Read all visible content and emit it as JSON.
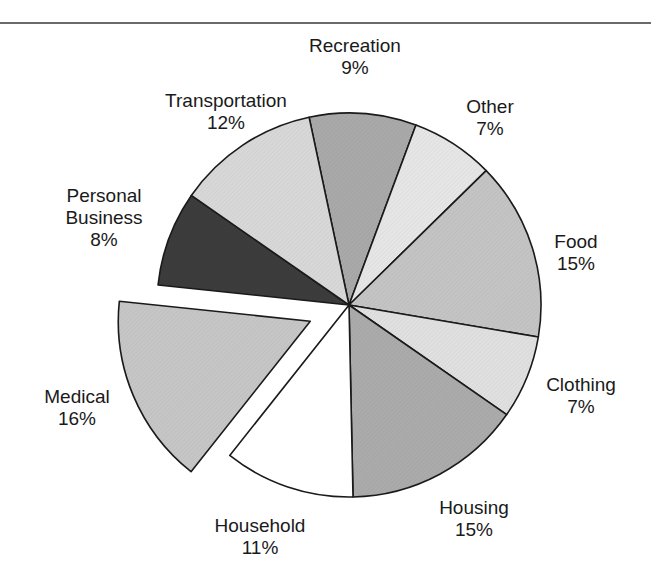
{
  "chart_data": {
    "type": "pie",
    "title": "",
    "start_angle_deg": -12,
    "direction": "clockwise",
    "exploded": [
      "Medical"
    ],
    "slices": [
      {
        "label": "Recreation",
        "value": 9,
        "display": "9%",
        "color": "#a9a9a9"
      },
      {
        "label": "Other",
        "value": 7,
        "display": "7%",
        "color": "#e6e6e6"
      },
      {
        "label": "Food",
        "value": 15,
        "display": "15%",
        "color": "#c4c4c4"
      },
      {
        "label": "Clothing",
        "value": 7,
        "display": "7%",
        "color": "#e0e0e0"
      },
      {
        "label": "Housing",
        "value": 15,
        "display": "15%",
        "color": "#ababab"
      },
      {
        "label": "Household",
        "value": 11,
        "display": "11%",
        "color": "#ffffff"
      },
      {
        "label": "Medical",
        "value": 16,
        "display": "16%",
        "color": "#c6c6c6"
      },
      {
        "label": "Personal Business",
        "value": 8,
        "display": "8%",
        "color": "#3c3c3c"
      },
      {
        "label": "Transportation",
        "value": 12,
        "display": "12%",
        "color": "#d8d8d8"
      }
    ],
    "legend": "none (direct labels)"
  },
  "labels": {
    "recreation": {
      "name": "Recreation",
      "pct": "9%"
    },
    "other": {
      "name": "Other",
      "pct": "7%"
    },
    "food": {
      "name": "Food",
      "pct": "15%"
    },
    "clothing": {
      "name": "Clothing",
      "pct": "7%"
    },
    "housing": {
      "name": "Housing",
      "pct": "15%"
    },
    "household": {
      "name": "Household",
      "pct": "11%"
    },
    "medical": {
      "name": "Medical",
      "pct": "16%"
    },
    "personal_business": {
      "name1": "Personal",
      "name2": "Business",
      "pct": "8%"
    },
    "transportation": {
      "name": "Transportation",
      "pct": "12%"
    }
  }
}
